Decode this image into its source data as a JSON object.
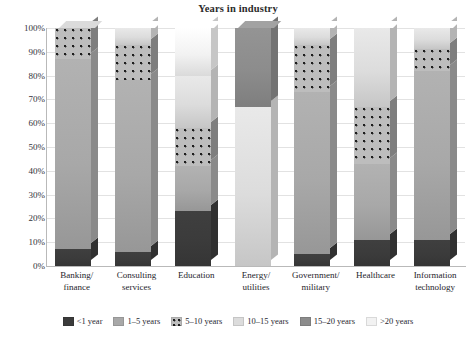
{
  "chart_data": {
    "type": "bar",
    "title": "Years in industry",
    "xlabel": "",
    "ylabel": "",
    "ylim": [
      0,
      100
    ],
    "stacked": true,
    "grid": true,
    "legend_position": "bottom",
    "categories": [
      "Banking/ finance",
      "Consulting services",
      "Education",
      "Energy/ utilities",
      "Government/ military",
      "Healthcare",
      "Information technology"
    ],
    "category_lines": [
      [
        "Banking/",
        "finance"
      ],
      [
        "Consulting",
        "services"
      ],
      [
        "Education",
        ""
      ],
      [
        "Energy/",
        "utilities"
      ],
      [
        "Government/",
        "military"
      ],
      [
        "Healthcare",
        ""
      ],
      [
        "Information",
        "technology"
      ]
    ],
    "y_ticks": [
      "0%",
      "10%",
      "20%",
      "30%",
      "40%",
      "50%",
      "60%",
      "70%",
      "80%",
      "90%",
      "100%"
    ],
    "series": [
      {
        "name": "<1 year",
        "color": "#3b3b3b",
        "pattern": "solid",
        "values": [
          7,
          6,
          23,
          0,
          5,
          11,
          11
        ]
      },
      {
        "name": "1–5 years",
        "color": "#a8a8a8",
        "pattern": "solid",
        "values": [
          80,
          72,
          19,
          0,
          68,
          32,
          71
        ]
      },
      {
        "name": "5–10 years",
        "color": "#bdbdbd",
        "pattern": "dotted",
        "values": [
          13,
          15,
          16,
          0,
          20,
          24,
          9
        ]
      },
      {
        "name": "10–15 years",
        "color": "#dcdcdc",
        "pattern": "solid",
        "values": [
          0,
          7,
          22,
          67,
          7,
          33,
          9
        ]
      },
      {
        "name": "15–20 years",
        "color": "#8c8c8c",
        "pattern": "solid",
        "values": [
          0,
          0,
          0,
          33,
          0,
          0,
          0
        ]
      },
      {
        "name": ">20 years",
        "color": "#f2f2f2",
        "pattern": "solid",
        "values": [
          0,
          0,
          20,
          0,
          0,
          0,
          0
        ]
      }
    ]
  },
  "legend": {
    "items": [
      {
        "label": "<1 year"
      },
      {
        "label": "1–5 years"
      },
      {
        "label": "5–10 years"
      },
      {
        "label": "10–15 years"
      },
      {
        "label": "15–20 years"
      },
      {
        "label": ">20 years"
      }
    ]
  }
}
